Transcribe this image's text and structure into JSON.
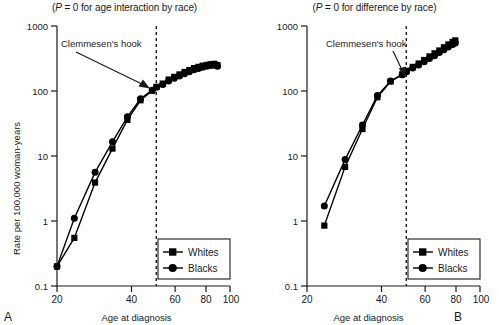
{
  "figure": {
    "shared": {
      "xlabel": "Age at diagnosis",
      "ylabel": "Rate per 100,000 woman-years",
      "annotation": "Clemmesen's hook",
      "legend": {
        "whites": "Whites",
        "blacks": "Blacks"
      },
      "xticks": [
        "20",
        "40",
        "60",
        "80",
        "100"
      ],
      "yticks": [
        "1000",
        "100",
        "10",
        "1",
        "0.1"
      ],
      "line_color": "#000000",
      "reference_line_age": 50
    },
    "panels": [
      {
        "letter": "A",
        "title_prefix": "(",
        "title_italic": "P",
        "title_rest": " = 0 for age interaction by race)"
      },
      {
        "letter": "B",
        "title_prefix": "(",
        "title_italic": "P",
        "title_rest": " = 0 for difference by race)"
      }
    ]
  },
  "chart_data": [
    {
      "type": "line",
      "panel": "A",
      "title": "(P = 0 for age interaction by race)",
      "xlabel": "Age at diagnosis",
      "ylabel": "Rate per 100,000 woman-years",
      "xscale": "log",
      "yscale": "log",
      "xlim": [
        20,
        100
      ],
      "ylim": [
        0.1,
        1000
      ],
      "xticks": [
        20,
        40,
        60,
        80,
        100
      ],
      "yticks": [
        0.1,
        1,
        10,
        100,
        1000
      ],
      "grid": false,
      "legend_position": "lower-right",
      "annotations": [
        {
          "text": "Clemmesen's hook",
          "x": 29,
          "y": 430
        },
        {
          "text": "reference line",
          "type": "vline",
          "x": 50
        }
      ],
      "series": [
        {
          "name": "Whites",
          "marker": "square",
          "x": [
            20,
            23.5,
            28.5,
            33.5,
            38.5,
            43.5,
            48.5,
            50.5,
            53.5,
            56.5,
            59.5,
            62.5,
            65.5,
            68.5,
            71.5,
            74.5,
            77.5,
            80.5,
            83.5,
            86.5,
            89
          ],
          "y": [
            0.2,
            0.55,
            3.9,
            13,
            36,
            72,
            101,
            116,
            130,
            150,
            165,
            180,
            196,
            210,
            225,
            235,
            245,
            252,
            258,
            262,
            250
          ]
        },
        {
          "name": "Blacks",
          "marker": "circle",
          "x": [
            20,
            23.5,
            28.5,
            33.5,
            38.5,
            43.5,
            48.5,
            50.5,
            53.5,
            56.5,
            59.5,
            62.5,
            65.5,
            68.5,
            71.5,
            74.5,
            77.5,
            80.5,
            83.5,
            86.5,
            89
          ],
          "y": [
            0.2,
            1.1,
            5.6,
            16.5,
            40,
            76,
            103,
            114,
            126,
            143,
            157,
            170,
            185,
            198,
            212,
            222,
            232,
            240,
            246,
            250,
            240
          ]
        }
      ]
    },
    {
      "type": "line",
      "panel": "B",
      "title": "(P = 0 for difference by race)",
      "xlabel": "Age at diagnosis",
      "ylabel": "Rate per 100,000 woman-years",
      "xscale": "log",
      "yscale": "log",
      "xlim": [
        20,
        100
      ],
      "ylim": [
        0.1,
        1000
      ],
      "xticks": [
        20,
        40,
        60,
        80,
        100
      ],
      "yticks": [
        0.1,
        1,
        10,
        100,
        1000
      ],
      "grid": false,
      "legend_position": "lower-right",
      "annotations": [
        {
          "text": "Clemmesen's hook",
          "x": 33,
          "y": 430
        },
        {
          "text": "reference line",
          "type": "vline",
          "x": 50
        }
      ],
      "series": [
        {
          "name": "Whites",
          "marker": "square",
          "x": [
            23.5,
            28.5,
            33.5,
            38.5,
            43.5,
            48.5,
            50.5,
            53.5,
            56.5,
            59.5,
            62.5,
            65.5,
            68.5,
            71.5,
            74.5,
            77.5,
            79.5
          ],
          "y": [
            0.85,
            6.8,
            26,
            80,
            140,
            180,
            205,
            235,
            265,
            300,
            340,
            380,
            420,
            470,
            520,
            570,
            600
          ]
        },
        {
          "name": "Blacks",
          "marker": "circle",
          "x": [
            23.5,
            28.5,
            33.5,
            38.5,
            43.5,
            48.5,
            50.5,
            53.5,
            56.5,
            59.5,
            62.5,
            65.5,
            68.5,
            71.5,
            74.5,
            77.5,
            79.5
          ],
          "y": [
            1.7,
            8.8,
            30,
            85,
            142,
            178,
            198,
            225,
            252,
            282,
            315,
            350,
            390,
            430,
            475,
            520,
            550
          ]
        }
      ]
    }
  ]
}
